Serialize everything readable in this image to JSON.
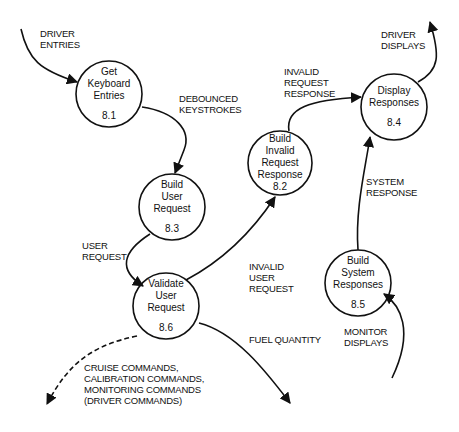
{
  "diagram": {
    "type": "data-flow-diagram",
    "processes": [
      {
        "id": "8.1",
        "lines": [
          "Get",
          "Keyboard",
          "Entries"
        ]
      },
      {
        "id": "8.2",
        "lines": [
          "Build",
          "Invalid",
          "Request",
          "Response"
        ]
      },
      {
        "id": "8.3",
        "lines": [
          "Build",
          "User",
          "Request"
        ]
      },
      {
        "id": "8.4",
        "lines": [
          "Display",
          "Responses"
        ]
      },
      {
        "id": "8.5",
        "lines": [
          "Build",
          "System",
          "Responses"
        ]
      },
      {
        "id": "8.6",
        "lines": [
          "Validate",
          "User",
          "Request"
        ]
      }
    ],
    "flows": [
      {
        "label_lines": [
          "DRIVER",
          "ENTRIES"
        ],
        "from": "external",
        "to": "8.1",
        "style": "solid"
      },
      {
        "label_lines": [
          "DEBOUNCED",
          "KEYSTROKES"
        ],
        "from": "8.1",
        "to": "8.3",
        "style": "solid"
      },
      {
        "label_lines": [
          "USER",
          "REQUEST"
        ],
        "from": "8.3",
        "to": "8.6",
        "style": "solid"
      },
      {
        "label_lines": [
          "INVALID",
          "USER",
          "REQUEST"
        ],
        "from": "8.6",
        "to": "8.2",
        "style": "solid"
      },
      {
        "label_lines": [
          "INVALID",
          "REQUEST",
          "RESPONSE"
        ],
        "from": "8.2",
        "to": "8.4",
        "style": "solid"
      },
      {
        "label_lines": [
          "SYSTEM",
          "RESPONSE"
        ],
        "from": "8.5",
        "to": "8.4",
        "style": "solid"
      },
      {
        "label_lines": [
          "DRIVER",
          "DISPLAYS"
        ],
        "from": "8.4",
        "to": "external",
        "style": "solid"
      },
      {
        "label_lines": [
          "MONITOR",
          "DISPLAYS"
        ],
        "from": "external",
        "to": "8.5",
        "style": "solid"
      },
      {
        "label_lines": [
          "FUEL QUANTITY"
        ],
        "from": "8.6",
        "to": "external",
        "style": "solid"
      },
      {
        "label_lines": [
          "CRUISE COMMANDS,",
          "CALIBRATION COMMANDS,",
          "MONITORING COMMANDS",
          "(DRIVER COMMANDS)"
        ],
        "from": "8.6",
        "to": "external",
        "style": "dashed"
      }
    ]
  }
}
